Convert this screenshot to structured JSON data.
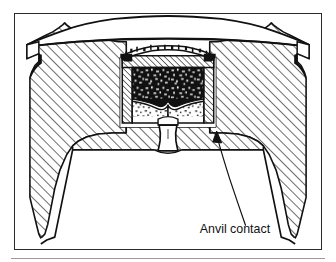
{
  "figure": {
    "kind": "technical-line-drawing",
    "view": "sectional-elevation",
    "frame": {
      "border_color": "#2b2b2b",
      "background": "#ffffff",
      "x": 14,
      "y": 13,
      "width": 308,
      "height": 237
    },
    "bottom_rule": {
      "color": "#9a9a9a",
      "x": 11,
      "y": 258,
      "width": 314
    },
    "annotations": [
      {
        "id": "anvil-contact",
        "label": "Anvil contact",
        "text_x": 186,
        "text_y": 221,
        "font_size": 11,
        "color": "#111111",
        "leader": {
          "from_x": 232,
          "from_y": 213,
          "to_x": 204,
          "to_y": 122,
          "arrow": true
        }
      }
    ],
    "colors": {
      "line": "#111111",
      "hatch": "#1a1a1a",
      "fill_metal": "#ffffff",
      "primer_compound": "#141414",
      "anvil_stipple": "#2a2a2a",
      "paper": "#ffffff"
    },
    "parts": [
      {
        "name": "case-head-body",
        "description": "hatched brass case head in section"
      },
      {
        "name": "primer-cup-dome",
        "description": "domed primer cup crown across top"
      },
      {
        "name": "primer-cup-wall",
        "description": "hatched cup side walls"
      },
      {
        "name": "primer-compound",
        "description": "dark stippled priming mix"
      },
      {
        "name": "anvil",
        "description": "light stippled anvil legs forming V"
      },
      {
        "name": "flash-hole",
        "description": "vertical flash hole channel"
      },
      {
        "name": "case-interior-cavity",
        "description": "flared trapezoidal powder cavity"
      }
    ]
  }
}
